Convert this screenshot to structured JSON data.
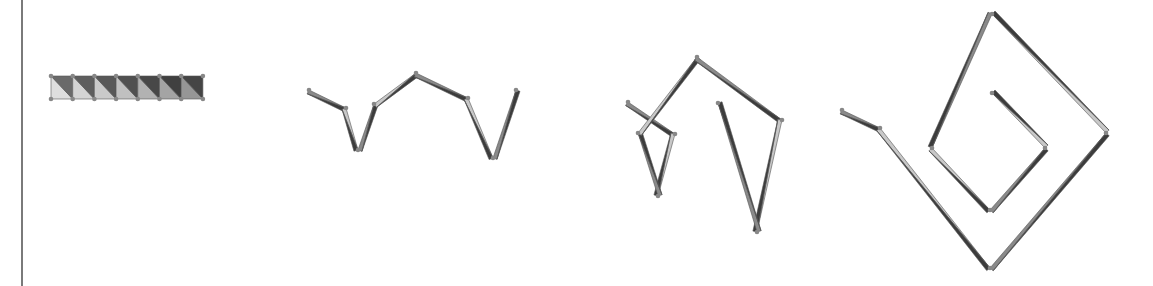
{
  "figure": {
    "colors": {
      "dark": "#3c3c3c",
      "mid": "#8a8a8a",
      "light": "#c8c8c8",
      "vertex": "#888888",
      "frame": "#7a7a7a"
    },
    "panels": [
      {
        "name": "flat-strip",
        "cells": 7,
        "x": 51,
        "y": 76,
        "cell_w": 21.7,
        "h": 23
      },
      {
        "name": "zigzag-fold",
        "path": [
          [
            309,
            90
          ],
          [
            346,
            108
          ],
          [
            358,
            150
          ],
          [
            374,
            104
          ],
          [
            416,
            73
          ],
          [
            468,
            98
          ],
          [
            493,
            158
          ],
          [
            516,
            90
          ]
        ],
        "offset": 7
      },
      {
        "name": "partial-fold",
        "path": [
          [
            628,
            102
          ],
          [
            675,
            134
          ],
          [
            658,
            196
          ],
          [
            638,
            133
          ],
          [
            697,
            57
          ],
          [
            782,
            120
          ],
          [
            757,
            232
          ],
          [
            718,
            103
          ]
        ],
        "offset": 7
      },
      {
        "name": "spiral-fold",
        "path": [
          [
            842,
            110
          ],
          [
            880,
            128
          ],
          [
            990,
            268
          ],
          [
            1106,
            133
          ],
          [
            992,
            14
          ],
          [
            932,
            148
          ],
          [
            990,
            210
          ],
          [
            1045,
            148
          ],
          [
            992,
            93
          ]
        ],
        "offset": 7
      }
    ]
  }
}
